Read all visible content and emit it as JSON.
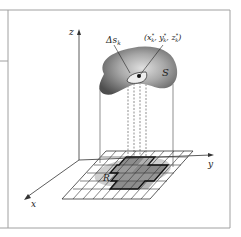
{
  "figure": {
    "type": "surface-integral-projection",
    "labels": {
      "z_axis": "z",
      "y_axis": "y",
      "x_axis": "x",
      "surface": "S",
      "region": "R",
      "patch": "Δs",
      "patch_sub": "k",
      "point_open": "(x",
      "point_x_sup": "*",
      "point_x_sub": "k",
      "point_y": ", y",
      "point_y_sup": "*",
      "point_y_sub": "k",
      "point_z": ", z",
      "point_z_sup": "*",
      "point_z_sub": "k",
      "point_close": ")"
    },
    "colors": {
      "frame": "#9a9a9a",
      "axis": "#333333",
      "surface_dark": "#555555",
      "surface_light": "#d8d8d8",
      "region_shadow": "#c8c8c8",
      "cell_dark": "#8a8a8a",
      "cell_mid": "#a8a8a8",
      "grid": "#333333"
    }
  }
}
